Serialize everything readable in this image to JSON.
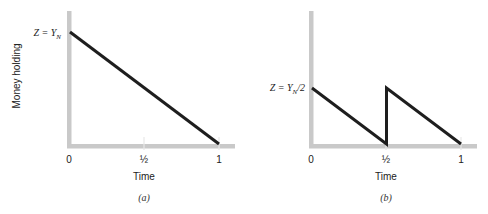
{
  "figure": {
    "y_axis_label": "Money holding"
  },
  "chart_data": [
    {
      "type": "line",
      "caption": "(a)",
      "title": "",
      "xlabel": "Time",
      "ylabel": "Money holding",
      "x_ticks": [
        "0",
        "½",
        "1"
      ],
      "y_annotation": "Z = Y_N",
      "y_annotation_text": "Z = Y",
      "y_annotation_sub": "N",
      "xlim": [
        0,
        1
      ],
      "ylim": [
        0,
        1.2
      ],
      "grid": false,
      "series": [
        {
          "name": "money holding",
          "x": [
            0,
            1
          ],
          "y": [
            1,
            0
          ]
        }
      ]
    },
    {
      "type": "line",
      "caption": "(b)",
      "title": "",
      "xlabel": "Time",
      "ylabel": "",
      "x_ticks": [
        "0",
        "½",
        "1"
      ],
      "y_annotation": "Z = Y_N/2",
      "y_annotation_text": "Z = Y",
      "y_annotation_sub": "N",
      "y_annotation_suffix": "/2",
      "xlim": [
        0,
        1
      ],
      "ylim": [
        0,
        1.2
      ],
      "grid": false,
      "series": [
        {
          "name": "money holding",
          "x": [
            0,
            0.5,
            0.5,
            1
          ],
          "y": [
            0.5,
            0,
            0.5,
            0
          ]
        }
      ]
    }
  ]
}
